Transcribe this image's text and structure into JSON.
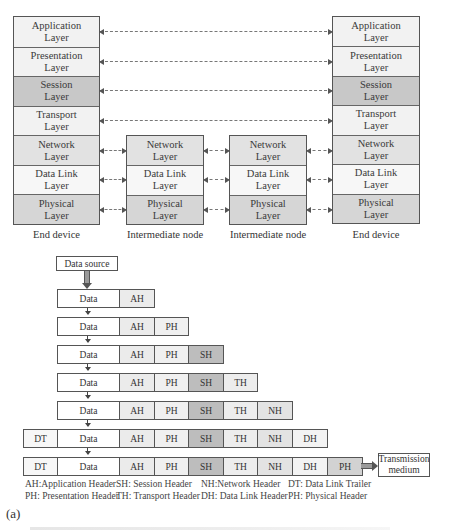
{
  "top_diagram": {
    "end_device_left": {
      "caption": "End device",
      "layers": [
        {
          "line1": "Application",
          "line2": "Layer",
          "fill": "#f2f2f2"
        },
        {
          "line1": "Presentation",
          "line2": "Layer",
          "fill": "#f2f2f2"
        },
        {
          "line1": "Session",
          "line2": "Layer",
          "fill": "#c8c8c8"
        },
        {
          "line1": "Transport",
          "line2": "Layer",
          "fill": "#f2f2f2"
        },
        {
          "line1": "Network",
          "line2": "Layer",
          "fill": "#e2e2e2"
        },
        {
          "line1": "Data Link",
          "line2": "Layer",
          "fill": "#f7f7f7"
        },
        {
          "line1": "Physical",
          "line2": "Layer",
          "fill": "#d6d6d6"
        }
      ]
    },
    "intermediate_node_1": {
      "caption": "Intermediate node",
      "layers": [
        {
          "line1": "Network",
          "line2": "Layer",
          "fill": "#e2e2e2"
        },
        {
          "line1": "Data Link",
          "line2": "Layer",
          "fill": "#f7f7f7"
        },
        {
          "line1": "Physical",
          "line2": "Layer",
          "fill": "#d6d6d6"
        }
      ]
    },
    "intermediate_node_2": {
      "caption": "Intermediate node",
      "layers": [
        {
          "line1": "Network",
          "line2": "Layer",
          "fill": "#e2e2e2"
        },
        {
          "line1": "Data Link",
          "line2": "Layer",
          "fill": "#f7f7f7"
        },
        {
          "line1": "Physical",
          "line2": "Layer",
          "fill": "#d6d6d6"
        }
      ]
    },
    "end_device_right": {
      "caption": "End device",
      "layers": [
        {
          "line1": "Application",
          "line2": "Layer",
          "fill": "#f2f2f2"
        },
        {
          "line1": "Presentation",
          "line2": "Layer",
          "fill": "#f2f2f2"
        },
        {
          "line1": "Session",
          "line2": "Layer",
          "fill": "#c8c8c8"
        },
        {
          "line1": "Transport",
          "line2": "Layer",
          "fill": "#f2f2f2"
        },
        {
          "line1": "Network",
          "line2": "Layer",
          "fill": "#e2e2e2"
        },
        {
          "line1": "Data Link",
          "line2": "Layer",
          "fill": "#f7f7f7"
        },
        {
          "line1": "Physical",
          "line2": "Layer",
          "fill": "#d6d6d6"
        }
      ]
    }
  },
  "encapsulation": {
    "source_label": "Data source",
    "rows": [
      [
        "Data",
        "AH"
      ],
      [
        "Data",
        "AH",
        "PH"
      ],
      [
        "Data",
        "AH",
        "PH",
        "SH"
      ],
      [
        "Data",
        "AH",
        "PH",
        "SH",
        "TH"
      ],
      [
        "Data",
        "AH",
        "PH",
        "SH",
        "TH",
        "NH"
      ],
      [
        "DT",
        "Data",
        "AH",
        "PH",
        "SH",
        "TH",
        "NH",
        "DH"
      ],
      [
        "DT",
        "Data",
        "AH",
        "PH",
        "SH",
        "TH",
        "NH",
        "DH",
        "PH"
      ]
    ],
    "colors": {
      "Data": "#ffffff",
      "DT": "#f7f7f7",
      "AH": "#ebebeb",
      "PH": "#f0f0f0",
      "SH": "#bdbdbd",
      "TH": "#ededed",
      "NH": "#e3e3e3",
      "DH": "#f3f3f3",
      "PH_final": "#d2d2d2"
    },
    "destination_line1": "Transmission",
    "destination_line2": "medium"
  },
  "legend": {
    "row1": [
      "AH:Application Header",
      "SH: Session Header",
      "NH:Network Header",
      "DT: Data Link Trailer"
    ],
    "row2": [
      "PH: Presentation Header",
      "TH: Transport Header",
      "DH: Data Link Header",
      "PH: Physical Header"
    ]
  },
  "figure_label": "(a)"
}
